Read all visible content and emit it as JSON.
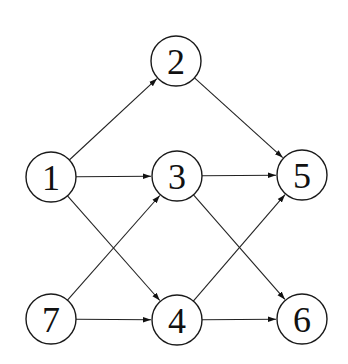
{
  "diagram": {
    "type": "directed-graph",
    "node_radius": 25,
    "colors": {
      "stroke": "#1a1a1a",
      "fill": "#ffffff",
      "text": "#111111",
      "background": "#ffffff"
    },
    "nodes": [
      {
        "id": "1",
        "label": "1",
        "x": 51,
        "y": 177
      },
      {
        "id": "2",
        "label": "2",
        "x": 176,
        "y": 61
      },
      {
        "id": "3",
        "label": "3",
        "x": 177,
        "y": 176
      },
      {
        "id": "4",
        "label": "4",
        "x": 177,
        "y": 320
      },
      {
        "id": "5",
        "label": "5",
        "x": 302,
        "y": 175
      },
      {
        "id": "6",
        "label": "6",
        "x": 302,
        "y": 319
      },
      {
        "id": "7",
        "label": "7",
        "x": 51,
        "y": 319
      }
    ],
    "edges": [
      {
        "from": "1",
        "to": "2"
      },
      {
        "from": "2",
        "to": "5"
      },
      {
        "from": "1",
        "to": "3"
      },
      {
        "from": "3",
        "to": "5"
      },
      {
        "from": "1",
        "to": "4"
      },
      {
        "from": "7",
        "to": "3"
      },
      {
        "from": "3",
        "to": "6"
      },
      {
        "from": "4",
        "to": "5"
      },
      {
        "from": "7",
        "to": "4"
      },
      {
        "from": "4",
        "to": "6"
      }
    ]
  }
}
